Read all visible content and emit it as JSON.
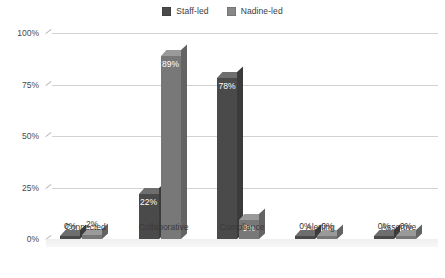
{
  "chart_data": {
    "type": "bar",
    "title": "",
    "subtitle": "",
    "xlabel": "",
    "ylabel": "",
    "categories": [
      "Connected",
      "Collaborative",
      "Compliance",
      "Alerting",
      "Assertive"
    ],
    "series": [
      {
        "name": "Staff-led",
        "color": "#4a4a4a",
        "values": [
          0,
          22,
          78,
          0,
          0
        ]
      },
      {
        "name": "Nadine-led",
        "color": "#787878",
        "values": [
          2,
          89,
          9,
          0,
          0
        ]
      }
    ],
    "value_labels": [
      [
        "0%",
        "22%",
        "78%",
        "0%",
        "0%"
      ],
      [
        "2%",
        "89%",
        "9%",
        "0%",
        "0%"
      ]
    ],
    "ylim": [
      0,
      100
    ],
    "ytick_values": [
      0,
      25,
      50,
      75,
      100
    ],
    "ytick_labels": [
      "0%",
      "25%",
      "50%",
      "75%",
      "100%"
    ],
    "grid": true,
    "legend_position": "top-center",
    "three_d": true
  },
  "legend": {
    "items": [
      {
        "label": "Staff-led",
        "swatch_color": "#4a4a4a"
      },
      {
        "label": "Nadine-led",
        "swatch_color": "#878787"
      }
    ]
  },
  "colors": {
    "background": "#ffffff",
    "gridline": "#d2d2d2",
    "axis": "#9a9a9a",
    "text": "#3a3a3a",
    "label_inside": "#ffffff"
  }
}
